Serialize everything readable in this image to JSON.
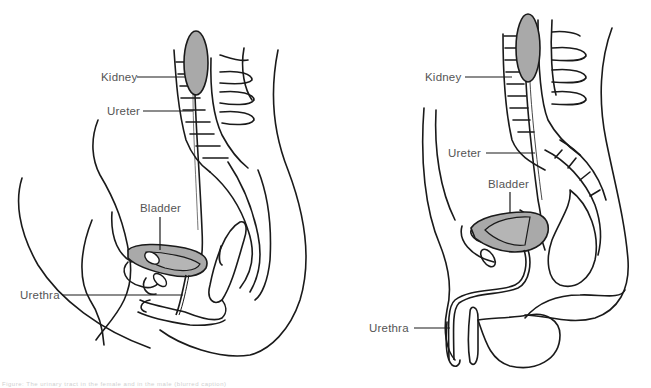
{
  "figure": {
    "caption": "Figure: The urinary tract in the female and in the male (blurred caption)",
    "colors": {
      "organ_fill": "#a9a9a9",
      "line": "#1a1a1a",
      "label_text": "#555555",
      "background": "#ffffff"
    },
    "panels": [
      {
        "id": "female",
        "labels": {
          "kidney": "Kidney",
          "ureter": "Ureter",
          "bladder": "Bladder",
          "urethra": "Urethra"
        }
      },
      {
        "id": "male",
        "labels": {
          "kidney": "Kidney",
          "ureter": "Ureter",
          "bladder": "Bladder",
          "urethra": "Urethra"
        }
      }
    ]
  }
}
